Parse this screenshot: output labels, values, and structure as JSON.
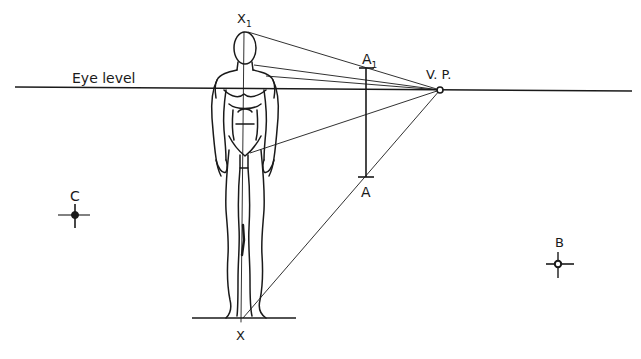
{
  "diagram": {
    "type": "perspective-construction",
    "colors": {
      "ink": "#1a1a1a",
      "background": "#ffffff"
    },
    "labels": {
      "eye_level": "Eye level",
      "vanishing_point": "V. P.",
      "x1_main": "X",
      "x1_sub": "1",
      "x": "X",
      "a1_main": "A",
      "a1_sub": "1",
      "a": "A",
      "b": "B",
      "c": "C"
    },
    "points": {
      "vp": [
        440,
        90
      ],
      "x1": [
        245,
        32
      ],
      "x": [
        241,
        318
      ],
      "a1": [
        366,
        68
      ],
      "a": [
        366,
        177
      ],
      "b": [
        558,
        264
      ],
      "c": [
        75,
        215
      ]
    },
    "horizon": {
      "x_start": 15,
      "y_start": 87,
      "x_end": 632,
      "y_end": 91
    },
    "ground_line": {
      "x_start": 192,
      "x_end": 296,
      "y": 318
    },
    "figure": "standing male figure, front view, with central vertical axis from X to X1"
  }
}
